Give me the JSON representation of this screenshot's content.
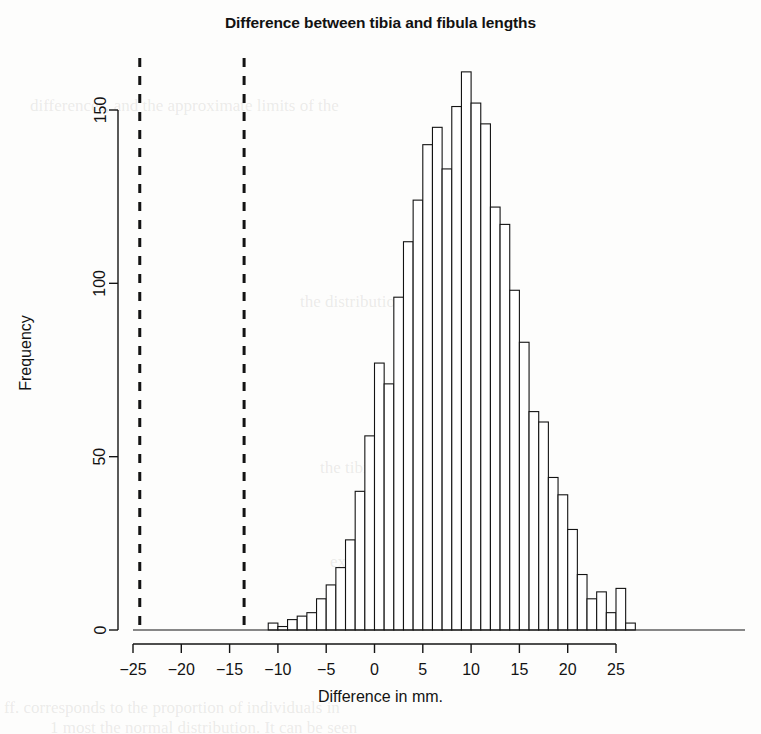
{
  "figure": {
    "title": "Difference between tibia and fibula lengths",
    "xlabel": "Difference in mm.",
    "ylabel": "Frequency",
    "background_color": "#fdfdfc",
    "ink_color": "#131313"
  },
  "chart_data": {
    "type": "bar",
    "title": "Difference between tibia and fibula lengths",
    "xlabel": "Difference in mm.",
    "ylabel": "Frequency",
    "xlim": [
      -26.5,
      27.5
    ],
    "ylim": [
      0,
      165
    ],
    "xticks": [
      -25,
      -20,
      -15,
      -10,
      -5,
      0,
      5,
      10,
      15,
      20,
      25
    ],
    "xtick_labels": [
      "-25",
      "-20",
      "-15",
      "-10",
      "-5",
      "0",
      "5",
      "10",
      "15",
      "20",
      "25"
    ],
    "yticks": [
      0,
      50,
      100,
      150
    ],
    "ytick_labels": [
      "0",
      "50",
      "100",
      "150"
    ],
    "grid": false,
    "legend": null,
    "bin_width": 1,
    "bin_starts": [
      -11,
      -10,
      -9,
      -8,
      -7,
      -6,
      -5,
      -4,
      -3,
      -2,
      -1,
      0,
      1,
      2,
      3,
      4,
      5,
      6,
      7,
      8,
      9,
      10,
      11,
      12,
      13,
      14,
      15,
      16,
      17,
      18,
      19,
      20,
      21,
      22,
      23,
      24,
      25,
      26
    ],
    "categories": [
      "-11",
      "-10",
      "-9",
      "-8",
      "-7",
      "-6",
      "-5",
      "-4",
      "-3",
      "-2",
      "-1",
      "0",
      "1",
      "2",
      "3",
      "4",
      "5",
      "6",
      "7",
      "8",
      "9",
      "10",
      "11",
      "12",
      "13",
      "14",
      "15",
      "16",
      "17",
      "18",
      "19",
      "20",
      "21",
      "22",
      "23",
      "24",
      "25",
      "26"
    ],
    "values": [
      2,
      1,
      3,
      4,
      5,
      9,
      13,
      18,
      26,
      40,
      56,
      77,
      71,
      96,
      112,
      124,
      140,
      145,
      133,
      151,
      161,
      152,
      146,
      122,
      117,
      98,
      83,
      63,
      60,
      44,
      39,
      29,
      16,
      9,
      11,
      5,
      12,
      2
    ],
    "annotations": [
      {
        "type": "vline",
        "x": -24.3,
        "style": "dashed",
        "linewidth": 3,
        "color": "#131313"
      },
      {
        "type": "vline",
        "x": -13.5,
        "style": "dashed",
        "linewidth": 3,
        "color": "#131313"
      }
    ]
  },
  "showthrough_lines": [
    {
      "text": "differences, and the approximate limits of the",
      "x": 30,
      "y": 106
    },
    {
      "text": "the distribution is shifted to the",
      "x": 300,
      "y": 300
    },
    {
      "text": "the tibia is usually longer",
      "x": 320,
      "y": 466
    },
    {
      "text": "expected distribution",
      "x": 330,
      "y": 560
    },
    {
      "text": "ff. corresponds to the proportion of individuals in",
      "x": 4,
      "y": 706
    },
    {
      "text": "1 most the normal distribution. It can be seen",
      "x": 50,
      "y": 726
    }
  ]
}
